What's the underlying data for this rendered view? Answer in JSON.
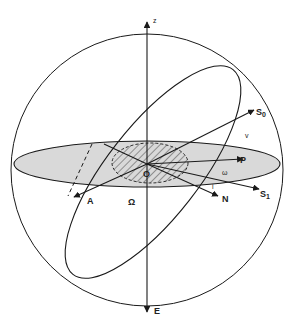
{
  "diagram": {
    "labels": {
      "z": "z",
      "E": "E",
      "O": "O",
      "A": "A",
      "Omega": "Ω",
      "N": "N",
      "P": "P",
      "S0": "S",
      "S0_sub": "0",
      "S1": "S",
      "S1_sub": "1",
      "v": "v",
      "omega": "ω",
      "i": "i"
    },
    "colors": {
      "stroke": "#1a1a1a",
      "plane_fill": "#d9d9d9",
      "background": "#ffffff"
    }
  }
}
